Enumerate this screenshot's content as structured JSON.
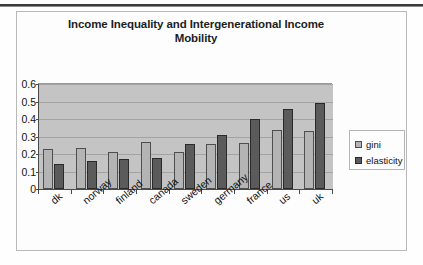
{
  "chart_data": {
    "type": "bar",
    "title": "Income Inequality and Intergenerational Income Mobility",
    "title_line1": "Income Inequality and Intergenerational Income",
    "title_line2": "Mobility",
    "xlabel": "",
    "ylabel": "",
    "ylim": [
      0,
      0.6
    ],
    "ytick_labels": [
      "0.6",
      "0.5",
      "0.4",
      "0.3",
      "0.2",
      "0.1",
      "0"
    ],
    "ytick_values": [
      0.6,
      0.5,
      0.4,
      0.3,
      0.2,
      0.1,
      0
    ],
    "grid": true,
    "legend_position": "right",
    "categories": [
      "dk",
      "norway",
      "finland",
      "canada",
      "sweden",
      "germany",
      "france",
      "us",
      "uk"
    ],
    "series": [
      {
        "name": "gini",
        "color": "#b4b4b4",
        "values": [
          0.23,
          0.235,
          0.21,
          0.27,
          0.21,
          0.26,
          0.265,
          0.34,
          0.33
        ]
      },
      {
        "name": "elasticity",
        "color": "#5b5b5b",
        "values": [
          0.145,
          0.16,
          0.17,
          0.18,
          0.255,
          0.31,
          0.4,
          0.46,
          0.49
        ]
      }
    ]
  },
  "legend": {
    "items": [
      {
        "label": "gini"
      },
      {
        "label": "elasticity"
      }
    ]
  },
  "colors": {
    "plot_background": "#c4c4c4",
    "gridline": "#a3a3a3",
    "axis": "#4a4a4a",
    "gini": "#b4b4b4",
    "elasticity": "#5b5b5b",
    "frame": "#b9b9b9",
    "page": "#fefefe"
  }
}
